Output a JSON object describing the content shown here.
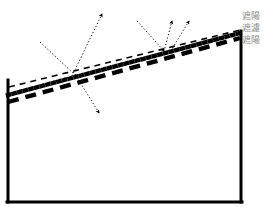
{
  "figure": {
    "background_color": "#ffffff",
    "stroke_color": "#000000",
    "label_color": "#8a8a8a"
  },
  "legend": {
    "entries": [
      {
        "id": "legend-line-1",
        "label": "遮陽"
      },
      {
        "id": "legend-line-2",
        "label": "遮濾"
      },
      {
        "id": "legend-line-3",
        "label": "遮陽"
      }
    ]
  },
  "enclosure": {
    "name": "building-section-outline",
    "left_wall": {
      "x1": 8,
      "y1": 80,
      "x2": 8,
      "y2": 202
    },
    "bottom_wall": {
      "x1": 8,
      "y1": 202,
      "x2": 241,
      "y2": 202
    },
    "right_wall": {
      "x1": 241,
      "y1": 31,
      "x2": 241,
      "y2": 202
    },
    "stroke_width": 3
  },
  "layers": [
    {
      "id": "layer-thin-dashed-upper",
      "name": "upper-thin-dashed-shading-line",
      "style": "thin-dashed",
      "stroke_width": 1.6,
      "dash": "6 5",
      "x1": 9,
      "y1": 87,
      "x2": 240,
      "y2": 30
    },
    {
      "id": "layer-thick-dotted-middle",
      "name": "middle-thick-dotted-shading-line",
      "style": "thick-dotted",
      "stroke_width": 4.4,
      "dash": "1.2 4.6",
      "x1": 8,
      "y1": 95,
      "x2": 240,
      "y2": 33
    },
    {
      "id": "layer-thick-dashed-lower",
      "name": "lower-thick-dashed-shading-line",
      "style": "thick-dashed",
      "stroke_width": 4.4,
      "dash": "11 7",
      "x1": 8,
      "y1": 102,
      "x2": 240,
      "y2": 38
    }
  ],
  "rays": [
    {
      "id": "ray-left-incident",
      "name": "left-incident-ray",
      "kind": "incident",
      "arrow": false,
      "x1": 40,
      "y1": 42,
      "x2": 75,
      "y2": 75
    },
    {
      "id": "ray-left-reflected-up",
      "name": "left-reflected-ray-upward",
      "kind": "reflected",
      "arrow": true,
      "x1": 72,
      "y1": 76,
      "x2": 104,
      "y2": 10
    },
    {
      "id": "ray-left-transmitted-down",
      "name": "left-transmitted-ray-downward",
      "kind": "transmitted",
      "arrow": true,
      "x1": 75,
      "y1": 74,
      "x2": 101,
      "y2": 117
    },
    {
      "id": "ray-right-incident",
      "name": "right-incident-ray",
      "kind": "incident",
      "arrow": true,
      "x1": 137,
      "y1": 21,
      "x2": 166,
      "y2": 54
    },
    {
      "id": "ray-right-reflected-a",
      "name": "right-reflected-ray-inner",
      "kind": "reflected",
      "arrow": true,
      "x1": 163,
      "y1": 55,
      "x2": 173,
      "y2": 17
    },
    {
      "id": "ray-right-reflected-b",
      "name": "right-reflected-ray-outer",
      "kind": "reflected",
      "arrow": true,
      "x1": 169,
      "y1": 54,
      "x2": 191,
      "y2": 17
    }
  ]
}
